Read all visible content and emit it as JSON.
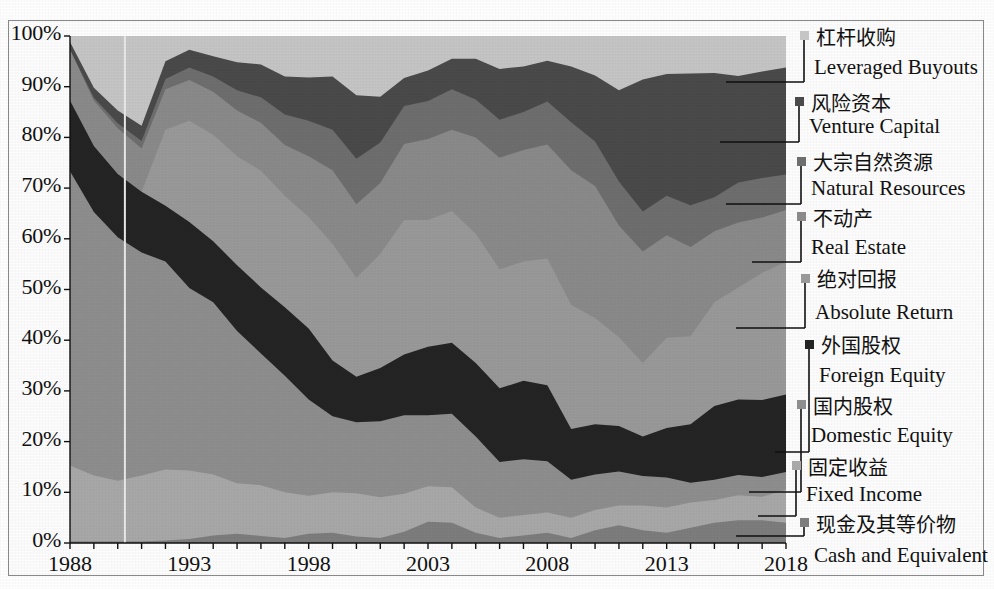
{
  "chart_data": {
    "type": "area",
    "title": "",
    "xlabel": "",
    "ylabel": "",
    "stacked": "100%",
    "grid": false,
    "legend_position": "right",
    "ylim": [
      0,
      100
    ],
    "ytick_labels": [
      "100%",
      "90%",
      "80%",
      "70%",
      "60%",
      "50%",
      "40%",
      "30%",
      "20%",
      "10%",
      "0%"
    ],
    "ytick_values": [
      100,
      90,
      80,
      70,
      60,
      50,
      40,
      30,
      20,
      10,
      0
    ],
    "xtick_labels": [
      "1988",
      "1993",
      "1998",
      "2003",
      "2008",
      "2013",
      "2018"
    ],
    "xtick_values": [
      1988,
      1993,
      1998,
      2003,
      2008,
      2013,
      2018
    ],
    "x": [
      1988,
      1989,
      1990,
      1991,
      1992,
      1993,
      1994,
      1995,
      1996,
      1997,
      1998,
      1999,
      2000,
      2001,
      2002,
      2003,
      2004,
      2005,
      2006,
      2007,
      2008,
      2009,
      2010,
      2011,
      2012,
      2013,
      2014,
      2015,
      2016,
      2017,
      2018
    ],
    "series": [
      {
        "name": "Cash and Equivalent",
        "name_cn": "现金及其等价物",
        "color": "#7d7d7d",
        "values": [
          0.3,
          0.3,
          0.3,
          0.3,
          0.5,
          0.8,
          1.5,
          1.8,
          1.4,
          1.0,
          1.8,
          2.0,
          1.3,
          1.0,
          2.2,
          4.2,
          4.0,
          2.0,
          1.0,
          1.5,
          2.0,
          1.0,
          2.5,
          3.5,
          2.5,
          2.0,
          3.0,
          4.0,
          4.5,
          4.5,
          4.0
        ]
      },
      {
        "name": "Fixed Income",
        "name_cn": "固定收益",
        "color": "#a8a8a8",
        "values": [
          15.0,
          13.0,
          12.0,
          13.0,
          14.0,
          13.5,
          12.0,
          10.0,
          10.0,
          9.0,
          7.5,
          8.0,
          8.5,
          8.0,
          7.5,
          7.0,
          7.0,
          5.0,
          4.0,
          4.0,
          4.0,
          4.0,
          4.0,
          3.9,
          4.9,
          5.0,
          5.0,
          4.5,
          4.9,
          4.6,
          6.5
        ]
      },
      {
        "name": "Domestic Equity",
        "name_cn": "国内股权",
        "color": "#8e8e8e",
        "values": [
          58.0,
          52.0,
          48.0,
          44.0,
          41.0,
          36.0,
          34.0,
          30.0,
          26.0,
          23.0,
          19.0,
          15.0,
          14.0,
          15.0,
          15.5,
          14.0,
          14.5,
          14.0,
          11.0,
          11.0,
          10.1,
          7.5,
          7.0,
          6.7,
          5.8,
          5.9,
          3.9,
          4.0,
          4.0,
          3.9,
          3.5
        ]
      },
      {
        "name": "Foreign Equity",
        "name_cn": "外国股权",
        "color": "#242424",
        "values": [
          14.0,
          13.0,
          12.5,
          12.0,
          11.0,
          13.0,
          12.0,
          13.0,
          13.0,
          13.5,
          14.0,
          11.0,
          9.0,
          10.5,
          12.0,
          13.5,
          14.0,
          14.5,
          14.5,
          15.5,
          15.0,
          10.0,
          9.9,
          9.0,
          7.8,
          9.8,
          11.5,
          14.5,
          14.9,
          15.2,
          15.3
        ]
      },
      {
        "name": "Absolute Return",
        "name_cn": "绝对回报",
        "color": "#999999",
        "values": [
          0.0,
          0.0,
          0.0,
          0.0,
          15.0,
          20.0,
          21.0,
          21.5,
          23.0,
          22.0,
          22.0,
          23.0,
          19.5,
          22.5,
          26.5,
          25.0,
          26.0,
          25.5,
          23.5,
          23.5,
          25.0,
          24.5,
          21.0,
          17.5,
          14.5,
          17.8,
          17.4,
          20.5,
          22.1,
          25.1,
          26.1
        ]
      },
      {
        "name": "Real Estate",
        "name_cn": "不动产",
        "color": "#8a8a8a",
        "values": [
          10.0,
          9.0,
          9.0,
          8.5,
          8.0,
          8.0,
          8.5,
          9.0,
          9.5,
          10.0,
          12.0,
          14.5,
          14.5,
          14.0,
          15.0,
          16.0,
          16.0,
          19.0,
          22.0,
          22.0,
          22.5,
          26.5,
          26.0,
          22.0,
          22.0,
          20.2,
          17.6,
          14.0,
          12.8,
          10.9,
          10.3
        ]
      },
      {
        "name": "Natural Resources",
        "name_cn": "大宗自然资源",
        "color": "#6e6e6e",
        "values": [
          0.0,
          0.5,
          1.0,
          1.5,
          2.0,
          2.5,
          3.0,
          4.0,
          5.0,
          6.0,
          7.0,
          8.0,
          9.0,
          8.0,
          7.5,
          7.5,
          8.0,
          7.5,
          7.5,
          7.5,
          8.5,
          9.5,
          8.8,
          8.7,
          7.9,
          7.8,
          8.2,
          6.7,
          7.9,
          7.8,
          7.0
        ]
      },
      {
        "name": "Venture Capital",
        "name_cn": "风险资本",
        "color": "#4a4a4a",
        "values": [
          1.5,
          2.0,
          2.5,
          3.0,
          3.5,
          3.5,
          4.0,
          5.5,
          6.5,
          7.5,
          8.5,
          10.5,
          12.5,
          9.0,
          5.5,
          6.0,
          6.0,
          8.0,
          10.0,
          9.0,
          8.0,
          11.0,
          13.0,
          18.0,
          26.0,
          24.0,
          26.0,
          24.5,
          21.0,
          21.0,
          21.1
        ]
      },
      {
        "name": "Leveraged Buyouts",
        "name_cn": "杠杆收购",
        "color": "#c5c5c5",
        "values": [
          1.2,
          10.2,
          14.7,
          17.7,
          5.0,
          2.7,
          4.0,
          5.2,
          5.6,
          8.0,
          8.2,
          8.0,
          11.7,
          12.0,
          8.3,
          6.8,
          4.5,
          4.5,
          6.5,
          6.0,
          4.9,
          6.0,
          7.8,
          10.7,
          8.6,
          7.5,
          7.4,
          7.3,
          7.9,
          7.0,
          6.2
        ]
      }
    ]
  },
  "legend": [
    {
      "cn": "杠杆收购",
      "en": "Leveraged Buyouts",
      "color": "#c5c5c5"
    },
    {
      "cn": "风险资本",
      "en": "Venture Capital",
      "color": "#4a4a4a"
    },
    {
      "cn": "大宗自然资源",
      "en": "Natural Resources",
      "color": "#6e6e6e"
    },
    {
      "cn": "不动产",
      "en": "Real Estate",
      "color": "#8a8a8a"
    },
    {
      "cn": "绝对回报",
      "en": "Absolute Return",
      "color": "#999999"
    },
    {
      "cn": "外国股权",
      "en": "Foreign Equity",
      "color": "#242424"
    },
    {
      "cn": "国内股权",
      "en": "Domestic Equity",
      "color": "#8e8e8e"
    },
    {
      "cn": "固定收益",
      "en": "Fixed Income",
      "color": "#a8a8a8"
    },
    {
      "cn": "现金及其等价物",
      "en": "Cash and Equivalent",
      "color": "#7d7d7d"
    }
  ]
}
